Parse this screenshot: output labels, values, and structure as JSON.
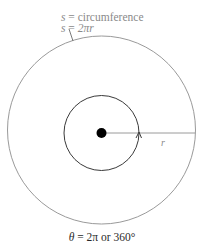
{
  "diagram": {
    "circumference_label": {
      "var": "s",
      "eq": " = ",
      "text": "circumference"
    },
    "formula_label": {
      "var": "s",
      "eq": " = ",
      "expr": "2πr"
    },
    "radius_label": "r",
    "angle_label": {
      "var": "θ",
      "eq": " = ",
      "expr": "2π or 360°"
    },
    "colors": {
      "outer_circle": "#9a9a9a",
      "inner_circle": "#3a3a3a",
      "radius_line": "#9a9a9a",
      "center_dot": "#000000",
      "label_gray": "#8a8a8a",
      "label_dark": "#2a2a2a"
    }
  }
}
